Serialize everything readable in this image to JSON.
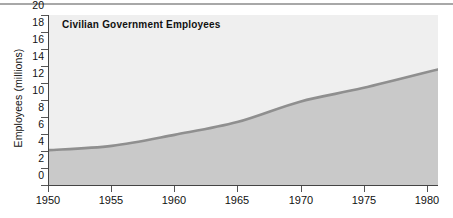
{
  "chart_data": {
    "type": "area",
    "title": "Civilian Government Employees",
    "xlabel": "",
    "ylabel": "Employees (millions)",
    "xlim": [
      1950,
      1981
    ],
    "ylim": [
      0,
      20
    ],
    "grid": false,
    "legend": false,
    "x_ticks": [
      "1950",
      "1955",
      "1960",
      "1965",
      "1970",
      "1975",
      "1980"
    ],
    "x_tick_values": [
      1950,
      1955,
      1960,
      1965,
      1970,
      1975,
      1980
    ],
    "y_ticks": [
      "0",
      "2",
      "4",
      "6",
      "8",
      "10",
      "12",
      "14",
      "16",
      "18",
      "20"
    ],
    "y_tick_values": [
      0,
      2,
      4,
      6,
      8,
      10,
      12,
      14,
      16,
      18,
      20
    ],
    "x": [
      1950,
      1955,
      1960,
      1965,
      1970,
      1975,
      1981
    ],
    "values": [
      4.1,
      4.6,
      5.9,
      7.4,
      9.8,
      11.4,
      13.6
    ],
    "series": [
      {
        "name": "Civilian Government Employees",
        "values": [
          4.1,
          4.6,
          5.9,
          7.4,
          9.8,
          11.4,
          13.6
        ]
      }
    ],
    "colors": {
      "plot_background": "#efefef",
      "area_fill": "#c9c9c9",
      "line": "#8f8f8f",
      "axis": "#444444",
      "text": "#111111",
      "top_rule": "#a8a8a8"
    }
  },
  "figure": {
    "top_rule_present": true
  }
}
